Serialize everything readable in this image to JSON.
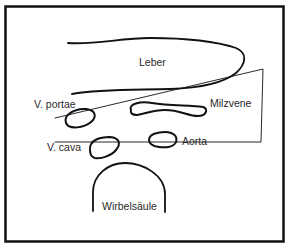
{
  "diagram": {
    "colors": {
      "stroke": "#111111",
      "text": "#2a2a2a",
      "background": "#ffffff"
    },
    "labels": {
      "leber": "Leber",
      "v_portae": "V. portae",
      "milzvene": "Milzvene",
      "v_cava": "V. cava",
      "aorta": "Aorta",
      "wirbelsaeule": "Wirbelsäule"
    }
  }
}
